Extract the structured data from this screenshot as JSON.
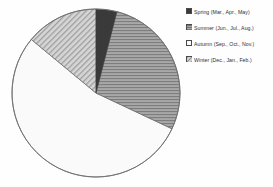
{
  "chart_data": {
    "type": "pie",
    "title": "",
    "subtitle": "",
    "xlabel": "",
    "ylabel": "",
    "grid": false,
    "legend_position": "right",
    "start_angle_deg": 0,
    "direction": "clockwise",
    "categories": [
      "Spring (Mar., Apr., May)",
      "Summer (Jun., Jul., Aug.)",
      "Autumn (Sep., Oct., Nov.)",
      "Winter (Dec., Jan., Feb.)"
    ],
    "values": [
      4,
      28,
      54,
      14
    ],
    "units": "percent",
    "annotations": []
  },
  "legend": {
    "items": [
      {
        "label": "Spring (Mar., Apr., May)",
        "swatch_name": "legend-swatch-spring",
        "fill": "#3a3a3a",
        "pattern": "solid"
      },
      {
        "label": "Summer (Jun., Jul., Aug.)",
        "swatch_name": "legend-swatch-summer",
        "fill": "#9a9a9a",
        "pattern": "horizontal-hatch"
      },
      {
        "label": "Autumn (Sep., Oct., Nov.)",
        "swatch_name": "legend-swatch-autumn",
        "fill": "#fbfbfb",
        "pattern": "none"
      },
      {
        "label": "Winter (Dec., Jan., Feb.)",
        "swatch_name": "legend-swatch-winter",
        "fill": "#c9c9c9",
        "pattern": "diagonal-hatch"
      }
    ]
  },
  "pie": {
    "center_x": 96,
    "center_y": 93,
    "radius": 84,
    "outline_color": "#6e6e6e",
    "slices": [
      {
        "name": "spring",
        "percent": 4,
        "fill": "#3a3a3a",
        "pattern": "solid"
      },
      {
        "name": "summer",
        "percent": 28,
        "fill": "#9d9d9d",
        "pattern": "horizontal-hatch"
      },
      {
        "name": "autumn",
        "percent": 54,
        "fill": "#fafafa",
        "pattern": "none"
      },
      {
        "name": "winter",
        "percent": 14,
        "fill": "#c6c6c6",
        "pattern": "diagonal-hatch"
      }
    ]
  }
}
